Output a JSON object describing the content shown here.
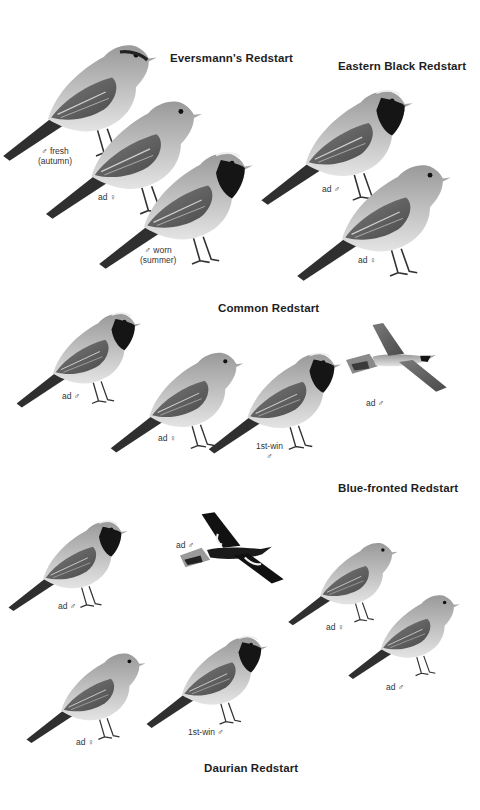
{
  "page": {
    "background": "#ffffff",
    "type": "field-guide-plate"
  },
  "species": [
    {
      "name": "Eversmann's Redstart",
      "figures": [
        {
          "label_line1": "♂ fresh",
          "label_line2": "(autumn)"
        },
        {
          "label_line1": "ad ♀",
          "label_line2": ""
        },
        {
          "label_line1": "♂ worn",
          "label_line2": "(summer)"
        }
      ]
    },
    {
      "name": "Eastern Black Redstart",
      "figures": [
        {
          "label_line1": "ad ♂",
          "label_line2": ""
        },
        {
          "label_line1": "ad ♀",
          "label_line2": ""
        }
      ]
    },
    {
      "name": "Common Redstart",
      "figures": [
        {
          "label_line1": "ad ♂",
          "label_line2": ""
        },
        {
          "label_line1": "ad ♀",
          "label_line2": ""
        },
        {
          "label_line1": "1st-win",
          "label_line2": "♂"
        },
        {
          "label_line1": "ad ♂",
          "label_line2": "",
          "pose": "flight"
        }
      ]
    },
    {
      "name": "Blue-fronted Redstart",
      "figures": [
        {
          "label_line1": "ad ♀",
          "label_line2": ""
        },
        {
          "label_line1": "ad ♂",
          "label_line2": ""
        }
      ]
    },
    {
      "name": "Daurian Redstart",
      "figures": [
        {
          "label_line1": "ad ♂",
          "label_line2": ""
        },
        {
          "label_line1": "ad ♂",
          "label_line2": "",
          "pose": "flight"
        },
        {
          "label_line1": "ad ♀",
          "label_line2": ""
        },
        {
          "label_line1": "1st-win ♂",
          "label_line2": ""
        }
      ]
    }
  ],
  "colors": {
    "body_light": "#d8d8d8",
    "body_mid": "#a8a8a8",
    "wing_dark": "#5a5a5a",
    "black_bib": "#141414",
    "tail": "#2e2e2e"
  }
}
